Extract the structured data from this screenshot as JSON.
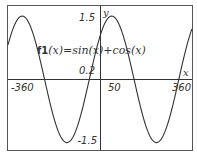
{
  "chart_data": {
    "type": "line",
    "title": "",
    "function_label": {
      "name": "f1",
      "expr": "(x)=sin(x)+cos(x)"
    },
    "xlabel": "x",
    "ylabel": "y",
    "xlim": [
      -372,
      368
    ],
    "ylim": [
      -1.58,
      1.64
    ],
    "x_tick_labels": [
      "-360",
      "50",
      "360"
    ],
    "y_tick_labels": [
      "1.5",
      "0.2",
      "-1.5"
    ],
    "grid": false,
    "series": [
      {
        "name": "f1",
        "formula": "sin(x)+cos(x)",
        "units": "degrees",
        "x": [
          -360,
          -315,
          -225,
          -135,
          -45,
          0,
          45,
          135,
          225,
          315,
          360
        ],
        "values": [
          1,
          1.414,
          0,
          -1.414,
          0,
          1,
          1.414,
          0,
          -1.414,
          0,
          1
        ]
      }
    ]
  },
  "colors": {
    "curve": "#333333",
    "axis": "#333333",
    "frame": "#555555",
    "background": "#ffffff"
  }
}
